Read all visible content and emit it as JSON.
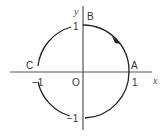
{
  "diagram": {
    "type": "unit-circle",
    "axes": {
      "x_label": "x",
      "y_label": "y"
    },
    "origin_label": "O",
    "points": [
      {
        "name": "A",
        "coords": [
          1,
          0
        ]
      },
      {
        "name": "B",
        "coords": [
          0,
          1
        ]
      },
      {
        "name": "C",
        "coords": [
          -1,
          0
        ]
      }
    ],
    "tick_labels": {
      "x_pos": "1",
      "x_neg": "−1",
      "y_pos": "1",
      "y_neg": "−1"
    },
    "arrow_direction": "counterclockwise",
    "colors": {
      "stroke": "#222222",
      "text": "#333333"
    }
  }
}
